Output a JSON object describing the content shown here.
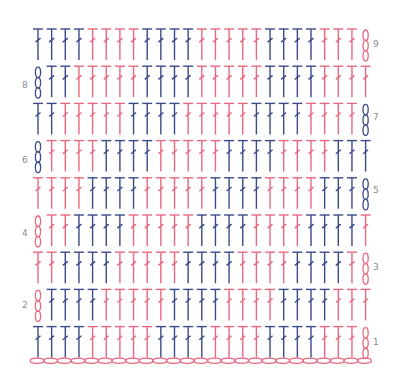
{
  "colors": {
    "blue": "#3b4a88",
    "pink": "#e8687f",
    "label": "#8a8a8a"
  },
  "legend": {
    "stitch": "double crochet (T with slash)",
    "chain": "chain (oval)"
  },
  "chart_data": {
    "type": "diagram",
    "stitches_per_row": 24,
    "rows": [
      {
        "row": 9,
        "label_side": "right",
        "turning_chain": "right",
        "chain_color": "pink",
        "blocks": [
          [
            "B",
            4
          ],
          [
            "P",
            4
          ],
          [
            "B",
            4
          ],
          [
            "P",
            5
          ],
          [
            "B",
            4
          ],
          [
            "P",
            3
          ]
        ]
      },
      {
        "row": 8,
        "label_side": "left",
        "turning_chain": "left",
        "chain_color": "blue",
        "blocks": [
          [
            "B",
            2
          ],
          [
            "P",
            5
          ],
          [
            "B",
            4
          ],
          [
            "P",
            5
          ],
          [
            "B",
            4
          ],
          [
            "P",
            4
          ]
        ]
      },
      {
        "row": 7,
        "label_side": "right",
        "turning_chain": "right",
        "chain_color": "blue",
        "blocks": [
          [
            "B",
            2
          ],
          [
            "P",
            5
          ],
          [
            "B",
            4
          ],
          [
            "P",
            5
          ],
          [
            "B",
            4
          ],
          [
            "P",
            4
          ]
        ]
      },
      {
        "row": 6,
        "label_side": "left",
        "turning_chain": "left",
        "chain_color": "blue",
        "blocks": [
          [
            "P",
            4
          ],
          [
            "B",
            4
          ],
          [
            "P",
            5
          ],
          [
            "B",
            4
          ],
          [
            "P",
            4
          ],
          [
            "B",
            3
          ]
        ]
      },
      {
        "row": 5,
        "label_side": "right",
        "turning_chain": "right",
        "chain_color": "blue",
        "blocks": [
          [
            "P",
            4
          ],
          [
            "B",
            4
          ],
          [
            "P",
            5
          ],
          [
            "B",
            4
          ],
          [
            "P",
            4
          ],
          [
            "B",
            3
          ]
        ]
      },
      {
        "row": 4,
        "label_side": "left",
        "turning_chain": "left",
        "chain_color": "pink",
        "blocks": [
          [
            "P",
            2
          ],
          [
            "B",
            4
          ],
          [
            "P",
            5
          ],
          [
            "B",
            4
          ],
          [
            "P",
            4
          ],
          [
            "B",
            4
          ],
          [
            "P",
            1
          ]
        ]
      },
      {
        "row": 3,
        "label_side": "right",
        "turning_chain": "right",
        "chain_color": "pink",
        "blocks": [
          [
            "P",
            2
          ],
          [
            "B",
            4
          ],
          [
            "P",
            5
          ],
          [
            "B",
            4
          ],
          [
            "P",
            4
          ],
          [
            "B",
            4
          ],
          [
            "P",
            1
          ]
        ]
      },
      {
        "row": 2,
        "label_side": "left",
        "turning_chain": "left",
        "chain_color": "pink",
        "blocks": [
          [
            "B",
            4
          ],
          [
            "P",
            5
          ],
          [
            "B",
            4
          ],
          [
            "P",
            4
          ],
          [
            "B",
            4
          ],
          [
            "P",
            3
          ]
        ]
      },
      {
        "row": 1,
        "label_side": "right",
        "turning_chain": "right",
        "chain_color": "pink",
        "blocks": [
          [
            "B",
            4
          ],
          [
            "P",
            5
          ],
          [
            "B",
            4
          ],
          [
            "P",
            4
          ],
          [
            "B",
            4
          ],
          [
            "P",
            3
          ]
        ]
      }
    ],
    "foundation_chain": {
      "count": 25,
      "color": "pink"
    }
  },
  "labels": {
    "r1": "1",
    "r2": "2",
    "r3": "3",
    "r4": "4",
    "r5": "5",
    "r6": "6",
    "r7": "7",
    "r8": "8",
    "r9": "9"
  }
}
